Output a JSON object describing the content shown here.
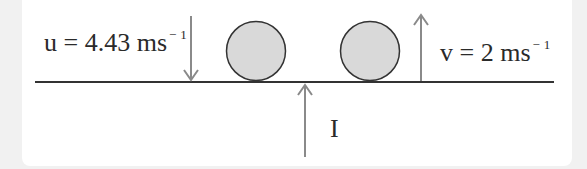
{
  "diagram": {
    "type": "physics-impulse-collision",
    "labels": {
      "initial_velocity": {
        "symbol": "u",
        "eq": "=",
        "value": "4.43",
        "unit": "ms",
        "exponent": "1",
        "neg": "−"
      },
      "final_velocity": {
        "symbol": "v",
        "eq": "=",
        "value": "2",
        "unit": "ms",
        "exponent": "1",
        "neg": "−"
      },
      "impulse": "I"
    },
    "colors": {
      "background_margin": "#f1f1f1",
      "panel": "#ffffff",
      "ground_line": "#333333",
      "arrow": "#8a8a8a",
      "ball_fill": "#d9d9d9",
      "ball_stroke": "#333333",
      "text": "#2a2a2a"
    },
    "elements": [
      {
        "id": "ground-line",
        "kind": "line"
      },
      {
        "id": "arrow-u",
        "kind": "arrow",
        "direction": "down"
      },
      {
        "id": "ball-before",
        "kind": "circle"
      },
      {
        "id": "ball-after",
        "kind": "circle"
      },
      {
        "id": "arrow-v",
        "kind": "arrow",
        "direction": "up"
      },
      {
        "id": "arrow-impulse",
        "kind": "arrow",
        "direction": "up"
      }
    ]
  }
}
